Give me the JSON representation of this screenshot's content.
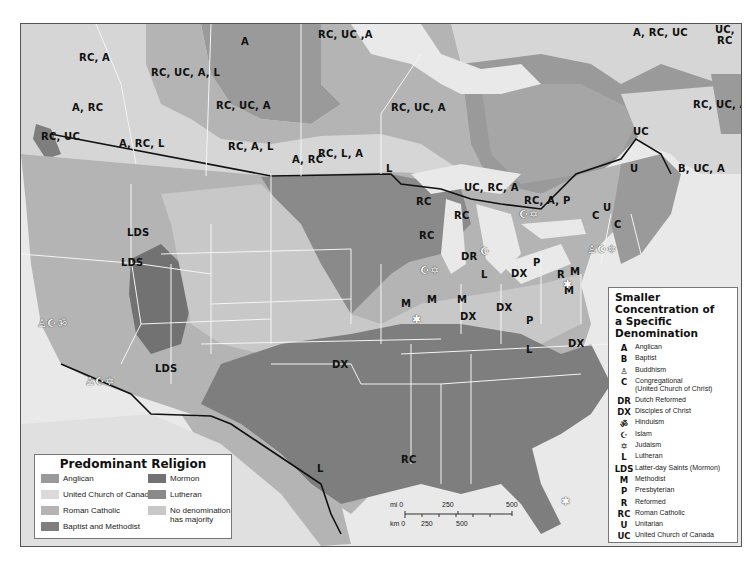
{
  "map": {
    "title": "Predominant Religion",
    "colors": {
      "anglican": "#9a9a9a",
      "united_church_of_canada": "#d6d6d6",
      "roman_catholic": "#b4b4b4",
      "baptist_methodist": "#7e7e7e",
      "mormon": "#727272",
      "lutheran": "#8a8a8a",
      "no_majority": "#c8c8c8",
      "ocean": "#e9e9e9",
      "border": "#111111",
      "state_lines": "#f4f4f4"
    },
    "region_labels": [
      {
        "text": "RC, A",
        "x": 78,
        "y": 57
      },
      {
        "text": "RC, UC, A, L",
        "x": 150,
        "y": 72
      },
      {
        "text": "A",
        "x": 240,
        "y": 41
      },
      {
        "text": "RC, UC ,A",
        "x": 317,
        "y": 34
      },
      {
        "text": "A, RC, UC",
        "x": 632,
        "y": 32
      },
      {
        "text": "UC,",
        "x": 714,
        "y": 29
      },
      {
        "text": "RC",
        "x": 716,
        "y": 40
      },
      {
        "text": "A, RC",
        "x": 71,
        "y": 107
      },
      {
        "text": "RC, UC, A",
        "x": 215,
        "y": 105
      },
      {
        "text": "RC, UC, A",
        "x": 390,
        "y": 107
      },
      {
        "text": "RC, UC",
        "x": 40,
        "y": 136
      },
      {
        "text": "A, RC, L",
        "x": 118,
        "y": 143
      },
      {
        "text": "RC, A, L",
        "x": 227,
        "y": 146
      },
      {
        "text": "A, RC",
        "x": 291,
        "y": 159
      },
      {
        "text": "RC, L, A",
        "x": 317,
        "y": 153
      },
      {
        "text": "L",
        "x": 385,
        "y": 168
      },
      {
        "text": "RC, UC, A",
        "x": 692,
        "y": 104
      },
      {
        "text": "UC",
        "x": 632,
        "y": 131
      },
      {
        "text": "U",
        "x": 629,
        "y": 168
      },
      {
        "text": "B, UC, A",
        "x": 677,
        "y": 168
      },
      {
        "text": "UC, RC, A",
        "x": 463,
        "y": 187
      },
      {
        "text": "RC, A, P",
        "x": 523,
        "y": 200
      },
      {
        "text": "RC",
        "x": 415,
        "y": 201
      },
      {
        "text": "RC",
        "x": 453,
        "y": 215
      },
      {
        "text": "C",
        "x": 591,
        "y": 215
      },
      {
        "text": "U",
        "x": 602,
        "y": 207
      },
      {
        "text": "C",
        "x": 613,
        "y": 224
      },
      {
        "text": "RC",
        "x": 418,
        "y": 235
      },
      {
        "text": "LDS",
        "x": 126,
        "y": 232
      },
      {
        "text": "LDS",
        "x": 120,
        "y": 262
      },
      {
        "text": "DR",
        "x": 460,
        "y": 256
      },
      {
        "text": "P",
        "x": 532,
        "y": 262
      },
      {
        "text": "L",
        "x": 480,
        "y": 274
      },
      {
        "text": "DX",
        "x": 510,
        "y": 273
      },
      {
        "text": "R",
        "x": 556,
        "y": 274
      },
      {
        "text": "M",
        "x": 569,
        "y": 271
      },
      {
        "text": "M",
        "x": 400,
        "y": 303
      },
      {
        "text": "M",
        "x": 426,
        "y": 299
      },
      {
        "text": "M",
        "x": 456,
        "y": 299
      },
      {
        "text": "M",
        "x": 563,
        "y": 290
      },
      {
        "text": "DX",
        "x": 495,
        "y": 307
      },
      {
        "text": "DX",
        "x": 459,
        "y": 316
      },
      {
        "text": "P",
        "x": 525,
        "y": 320
      },
      {
        "text": "LDS",
        "x": 154,
        "y": 368
      },
      {
        "text": "DX",
        "x": 331,
        "y": 364
      },
      {
        "text": "L",
        "x": 525,
        "y": 349
      },
      {
        "text": "DX",
        "x": 567,
        "y": 343
      },
      {
        "text": "RC",
        "x": 400,
        "y": 459
      },
      {
        "text": "L",
        "x": 316,
        "y": 468
      }
    ],
    "symbol_markers": [
      {
        "symbols": "buddhism-islam-hinduism",
        "glyphs": "♙☪ॐ",
        "x": 36,
        "y": 320
      },
      {
        "symbols": "buddhism-islam-judaism",
        "glyphs": "♙☪✡",
        "x": 84,
        "y": 380
      },
      {
        "symbols": "islam-judaism",
        "glyphs": "☪✡",
        "x": 518,
        "y": 213
      },
      {
        "symbols": "islam",
        "glyphs": "☪",
        "x": 479,
        "y": 250
      },
      {
        "symbols": "islam-judaism",
        "glyphs": "☪✡",
        "x": 419,
        "y": 269
      },
      {
        "symbols": "buddhism-islam-judaism",
        "glyphs": "♙☪✡",
        "x": 586,
        "y": 248
      },
      {
        "symbols": "capital-star",
        "glyphs": "✱",
        "x": 411,
        "y": 318
      },
      {
        "symbols": "capital-star",
        "glyphs": "✱",
        "x": 562,
        "y": 283
      },
      {
        "symbols": "capital-star",
        "glyphs": "✱",
        "x": 560,
        "y": 500
      }
    ]
  },
  "legend_main": {
    "title": "Predominant Religion",
    "items": [
      {
        "label": "Anglican",
        "color": "#9a9a9a"
      },
      {
        "label": "United Church of Canada",
        "color": "#dadada"
      },
      {
        "label": "Roman Catholic",
        "color": "#b4b4b4"
      },
      {
        "label": "Baptist and Methodist",
        "color": "#7e7e7e"
      },
      {
        "label": "Mormon",
        "color": "#727272"
      },
      {
        "label": "Lutheran",
        "color": "#8a8a8a"
      },
      {
        "label": "No denomination has majority",
        "line1": "No denomination",
        "line2": "has majority",
        "color": "#c8c8c8"
      }
    ]
  },
  "legend_side": {
    "title_line1": "Smaller Concentration of",
    "title_line2": "a Specific Denomination",
    "items": [
      {
        "code": "A",
        "label": "Anglican"
      },
      {
        "code": "B",
        "label": "Baptist"
      },
      {
        "code": "♙",
        "label": "Buddhism",
        "icon": "buddhism-icon"
      },
      {
        "code": "C",
        "label": "Congregational",
        "label2": "(United Church of Christ)"
      },
      {
        "code": "DR",
        "label": "Dutch Reformed"
      },
      {
        "code": "DX",
        "label": "Disciples of Christ"
      },
      {
        "code": "ॐ",
        "label": "Hinduism",
        "icon": "hinduism-icon"
      },
      {
        "code": "☪",
        "label": "Islam",
        "icon": "islam-icon"
      },
      {
        "code": "✡",
        "label": "Judaism",
        "icon": "judaism-icon"
      },
      {
        "code": "L",
        "label": "Lutheran"
      },
      {
        "code": "LDS",
        "label": "Latter-day Saints (Mormon)"
      },
      {
        "code": "M",
        "label": "Methodist"
      },
      {
        "code": "P",
        "label": "Presbyterian"
      },
      {
        "code": "R",
        "label": "Reformed"
      },
      {
        "code": "RC",
        "label": "Roman Catholic"
      },
      {
        "code": "U",
        "label": "Unitarian"
      },
      {
        "code": "UC",
        "label": "United Church of Canada"
      }
    ]
  },
  "scale_bar": {
    "mi_label": "mi 0",
    "mi_250": "250",
    "mi_500": "500",
    "km_label": "km 0",
    "km_250": "250",
    "km_500": "500"
  }
}
